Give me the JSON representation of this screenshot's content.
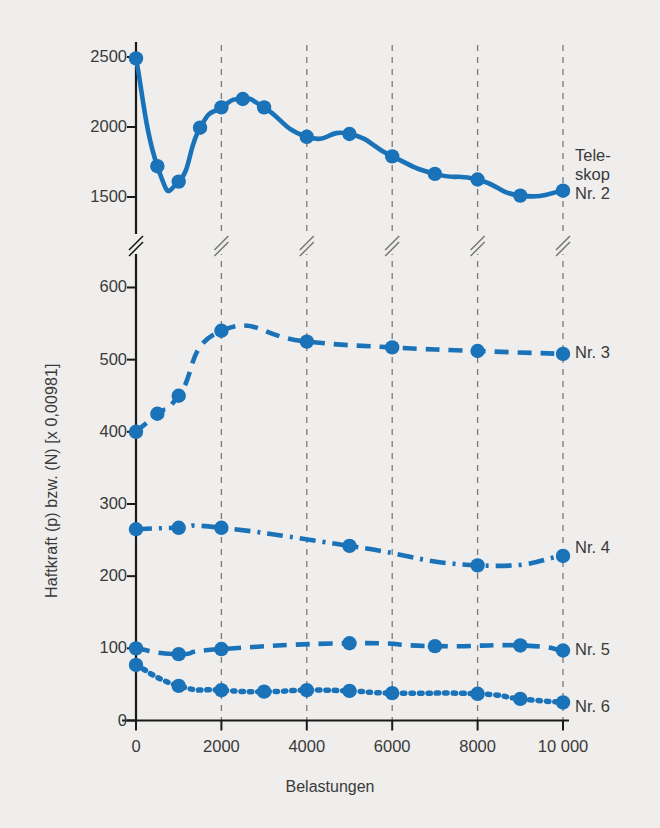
{
  "figure": {
    "background_color": "#efeeec",
    "accent_color": "#1a72b8",
    "axis_color": "#1a1a1a",
    "grid_color": "#7a7a7a",
    "text_color": "#3a3a3a"
  },
  "chart_data": {
    "type": "line",
    "title": "",
    "xlabel": "Belastungen",
    "ylabel": "Haftkraft (p) bzw. (N) [x 0,00981]",
    "grid": "vertical-dashed",
    "legend_position": "right-inline",
    "axis_break": {
      "present": true,
      "note": "broken y-axis between 600 and 1500",
      "lower_range": [
        0,
        600
      ],
      "upper_range": [
        1500,
        2500
      ]
    },
    "x": [
      0,
      500,
      1000,
      1500,
      2000,
      2500,
      3000,
      4000,
      5000,
      6000,
      7000,
      8000,
      9000,
      10000
    ],
    "xlim": [
      0,
      10000
    ],
    "xticks": [
      0,
      2000,
      4000,
      6000,
      8000,
      10000
    ],
    "xticklabels": [
      "0",
      "2000",
      "4000",
      "6000",
      "8000",
      "10000"
    ],
    "yticks": [
      0,
      100,
      200,
      300,
      400,
      500,
      600,
      1500,
      2000,
      2500
    ],
    "yticklabels": [
      "0",
      "100",
      "200",
      "300",
      "400",
      "500",
      "600",
      "1500",
      "2000",
      "2500"
    ],
    "series": [
      {
        "name": "Teleskop Nr. 2",
        "label": "Nr. 2",
        "label_prefix_lines": [
          "Tele-",
          "skop"
        ],
        "linestyle": "solid",
        "color": "#1a72b8",
        "x": [
          0,
          500,
          1000,
          1500,
          2000,
          2500,
          3000,
          4000,
          5000,
          6000,
          7000,
          8000,
          9000,
          10000
        ],
        "values": [
          2490,
          1720,
          1610,
          1995,
          2140,
          2200,
          2140,
          1930,
          1950,
          1790,
          1665,
          1625,
          1510,
          1545
        ]
      },
      {
        "name": "Teleskop Nr. 3",
        "label": "Nr. 3",
        "linestyle": "dashed",
        "color": "#1a72b8",
        "x": [
          0,
          500,
          1000,
          2000,
          4000,
          6000,
          8000,
          10000
        ],
        "values": [
          400,
          425,
          450,
          540,
          525,
          517,
          512,
          508
        ]
      },
      {
        "name": "Teleskop Nr. 4",
        "label": "Nr. 4",
        "linestyle": "dashdot",
        "color": "#1a72b8",
        "x": [
          0,
          1000,
          2000,
          5000,
          8000,
          10000
        ],
        "values": [
          265,
          267,
          267,
          242,
          215,
          228
        ]
      },
      {
        "name": "Teleskop Nr. 5",
        "label": "Nr. 5",
        "linestyle": "dashed",
        "color": "#1a72b8",
        "x": [
          0,
          1000,
          2000,
          5000,
          7000,
          9000,
          10000
        ],
        "values": [
          100,
          92,
          99,
          107,
          103,
          104,
          97
        ]
      },
      {
        "name": "Teleskop Nr. 6",
        "label": "Nr. 6",
        "linestyle": "dotted",
        "color": "#1a72b8",
        "x": [
          0,
          1000,
          2000,
          3000,
          4000,
          5000,
          6000,
          8000,
          9000,
          10000
        ],
        "values": [
          77,
          48,
          42,
          40,
          42,
          41,
          38,
          37,
          30,
          25
        ]
      }
    ]
  },
  "labels": {
    "ylabel": "Haftkraft (p) bzw. (N) [x 0,00981]",
    "xlabel": "Belastungen",
    "yticks": [
      "2500",
      "2000",
      "1500",
      "600",
      "500",
      "400",
      "300",
      "200",
      "100",
      "0"
    ],
    "xticks": [
      "0",
      "2000",
      "4000",
      "6000",
      "8000",
      "10000"
    ],
    "series_right": {
      "teleskop_line1": "Tele-",
      "teleskop_line2": "skop",
      "nr2": "Nr. 2",
      "nr3": "Nr. 3",
      "nr4": "Nr. 4",
      "nr5": "Nr. 5",
      "nr6": "Nr. 6"
    }
  }
}
